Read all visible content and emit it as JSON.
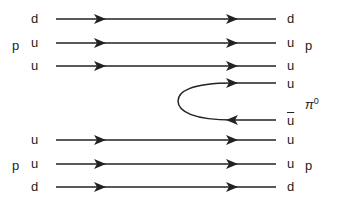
{
  "diagram": {
    "type": "quark-flow (Feynman-style) diagram",
    "left_labels": {
      "top_proton": {
        "hadron": "p",
        "quarks": [
          "d",
          "u",
          "u"
        ]
      },
      "bottom_proton": {
        "hadron": "p",
        "quarks": [
          "u",
          "u",
          "d"
        ]
      }
    },
    "right_labels": {
      "top_proton": {
        "hadron": "p",
        "quarks": [
          "d",
          "u",
          "u"
        ]
      },
      "pion": {
        "hadron": "π",
        "superscript": "0",
        "quarks": [
          "u",
          "u"
        ],
        "antiquark_index": 1
      },
      "bottom_proton": {
        "hadron": "p",
        "quarks": [
          "u",
          "u",
          "d"
        ]
      }
    },
    "line_color": "#222222"
  }
}
